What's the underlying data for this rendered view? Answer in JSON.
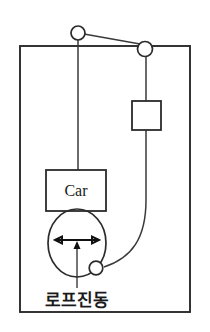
{
  "diagram": {
    "colors": {
      "line": "#2b2b2b",
      "rope": "#3a3a3a",
      "arrow": "#111111",
      "background": "#ffffff",
      "text": "#1a1a1a"
    },
    "labels": {
      "car": "Car",
      "rope_vibration": "로프진동"
    },
    "components": [
      {
        "name": "hoistway-frame",
        "type": "rectangle"
      },
      {
        "name": "drive-sheave-pulley",
        "type": "circle"
      },
      {
        "name": "deflector-pulley",
        "type": "circle"
      },
      {
        "name": "counterweight",
        "type": "rectangle"
      },
      {
        "name": "elevator-car",
        "type": "rectangle",
        "label": "Car"
      },
      {
        "name": "rope-vibration-envelope",
        "type": "oval"
      },
      {
        "name": "vibration-amplitude-arrow",
        "type": "double-arrow"
      },
      {
        "name": "compensating-sheave",
        "type": "circle"
      },
      {
        "name": "callout-leader",
        "type": "line"
      }
    ]
  }
}
